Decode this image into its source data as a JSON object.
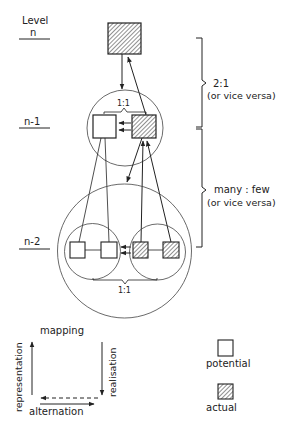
{
  "levels": {
    "title": "Level",
    "n": "n",
    "n_minus_1": "n-1",
    "n_minus_2": "n-2"
  },
  "brackets": {
    "upper": {
      "ratio": "2:1",
      "note": "(or vice versa)"
    },
    "lower": {
      "ratio": "many : few",
      "note": "(or vice versa)"
    }
  },
  "one_to_one": {
    "level_n1": "1:1",
    "level_n2": "1:1"
  },
  "legend": {
    "mapping": "mapping",
    "representation": "representation",
    "realisation": "realisation",
    "alternation": "alternation",
    "potential": "potential",
    "actual": "actual"
  },
  "colors": {
    "stroke": "#222222",
    "hatch": "#555555",
    "background": "#ffffff"
  }
}
